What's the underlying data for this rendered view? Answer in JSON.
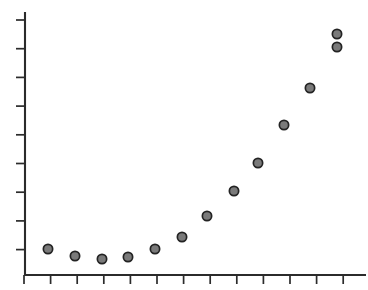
{
  "chart_data": {
    "type": "scatter",
    "title": "",
    "subtitle": "",
    "xlabel": "",
    "ylabel": "",
    "grid": false,
    "legend": null,
    "annotations": [],
    "xlim": [
      0,
      13
    ],
    "ylim": [
      0,
      9
    ],
    "xticklabels": [],
    "yticklabels": [],
    "xticks": [
      0,
      1,
      2,
      3,
      4,
      5,
      6,
      7,
      8,
      9,
      10,
      11,
      12
    ],
    "yticks": [
      1,
      2,
      3,
      4,
      5,
      6,
      7,
      8,
      9
    ],
    "marker": {
      "shape": "circle",
      "fill_color": "#7a7a7a",
      "edge_color": "#232323",
      "diameter_px": 11
    },
    "series": [
      {
        "name": "series-1",
        "x": [
          0.9,
          1.9,
          2.9,
          3.9,
          4.9,
          5.9,
          6.9,
          7.8,
          8.8,
          9.8,
          10.8,
          11.8,
          12.7
        ],
        "y": [
          1.03,
          0.79,
          0.69,
          0.79,
          1.03,
          1.42,
          2.12,
          2.98,
          3.95,
          5.25,
          6.52,
          7.93,
          9.35
        ],
        "points_px": [
          {
            "cx": 48,
            "cy": 249
          },
          {
            "cx": 75,
            "cy": 256
          },
          {
            "cx": 102,
            "cy": 259
          },
          {
            "cx": 128,
            "cy": 257
          },
          {
            "cx": 155,
            "cy": 249
          },
          {
            "cx": 182,
            "cy": 237
          },
          {
            "cx": 207,
            "cy": 216
          },
          {
            "cx": 234,
            "cy": 191
          },
          {
            "cx": 258,
            "cy": 163
          },
          {
            "cx": 284,
            "cy": 125
          },
          {
            "cx": 310,
            "cy": 88
          },
          {
            "cx": 337,
            "cy": 47
          },
          {
            "cx": 337,
            "cy": 34
          }
        ]
      }
    ]
  },
  "axes": {
    "name": "cartesian-axes",
    "y_axis": {
      "x": 25,
      "y_top": 12,
      "y_bottom": 276
    },
    "x_axis": {
      "y": 275,
      "x_left": 25,
      "x_right": 366
    },
    "y_tick_positions": [
      20,
      48.7,
      77.4,
      106.1,
      134.8,
      163.5,
      192.2,
      220.9,
      249.6
    ],
    "y_tick_inner_x": 25,
    "y_tick_outer_x": 16,
    "x_tick_positions": [
      24,
      50.6,
      77.2,
      103.8,
      130.4,
      157,
      183.6,
      210.2,
      236.8,
      263.4,
      290,
      316.6,
      343.2
    ],
    "x_tick_inner_y": 275,
    "x_tick_outer_y": 284
  },
  "colors": {
    "background": "#ffffff",
    "axis": "#2b2b2b",
    "marker_fill": "#7a7a7a",
    "marker_edge": "#232323"
  }
}
